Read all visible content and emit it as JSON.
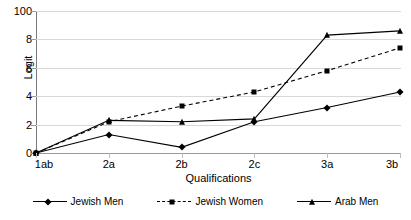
{
  "chart_data": {
    "type": "line",
    "title": "",
    "xlabel": "Qualifications",
    "ylabel": "Logit",
    "categories": [
      "1ab",
      "2a",
      "2b",
      "2c",
      "3a",
      "3b"
    ],
    "ylim": [
      0,
      10
    ],
    "yticks": [
      0,
      2,
      4,
      6,
      8,
      10
    ],
    "ytick_labels": [
      "0",
      "2",
      "4",
      "6",
      "8",
      "100"
    ],
    "grid": true,
    "legend_position": "bottom",
    "series": [
      {
        "name": "Jewish Men",
        "marker": "diamond",
        "linestyle": "solid",
        "color": "#000000",
        "values": [
          0,
          1.3,
          0.4,
          2.2,
          3.2,
          4.3
        ]
      },
      {
        "name": "Jewish Women",
        "marker": "square",
        "linestyle": "dashed",
        "color": "#000000",
        "values": [
          0,
          2.2,
          3.3,
          4.3,
          5.8,
          7.4
        ]
      },
      {
        "name": "Arab Men",
        "marker": "triangle",
        "linestyle": "solid",
        "color": "#000000",
        "values": [
          0,
          2.3,
          2.2,
          2.4,
          8.3,
          8.6
        ]
      }
    ]
  },
  "legend": {
    "items": [
      {
        "label": "Jewish Men"
      },
      {
        "label": "Jewish Women"
      },
      {
        "label": "Arab Men"
      }
    ]
  },
  "axes": {
    "y_title": "Logit",
    "x_title": "Qualifications"
  },
  "colors": {
    "line": "#000000",
    "grid": "#d8d8d8",
    "axis": "#9a9a9a",
    "background": "#ffffff"
  }
}
